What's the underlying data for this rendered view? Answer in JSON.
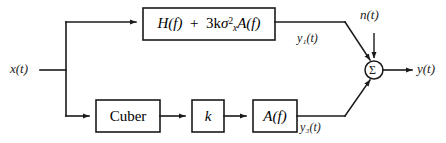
{
  "diagram": {
    "background_color": "#ffffff",
    "line_color": "#1a1a1a",
    "input": {
      "label": "x(t)",
      "name": "input-signal-label"
    },
    "output": {
      "label": "y(t)",
      "name": "output-signal-label"
    },
    "noise": {
      "label": "n(t)",
      "name": "noise-signal-label"
    },
    "blocks": [
      {
        "id": "linear-path-block",
        "label_parts": {
          "h_of_f": "H(f)",
          "plus": "+",
          "gain": "3k",
          "sigma": "σ",
          "sigma_sup": "2",
          "sigma_sub": "x",
          "a_of_f": "A(f)"
        },
        "label_plain": "H(f) + 3kσ²ₓA(f)",
        "x": 143,
        "y": 8,
        "width": 132,
        "height": 32
      },
      {
        "id": "cuber-block",
        "label_plain": "Cuber",
        "x": 96,
        "y": 100,
        "width": 64,
        "height": 32
      },
      {
        "id": "gain-k-block",
        "label_plain": "k",
        "x": 192,
        "y": 100,
        "width": 32,
        "height": 32
      },
      {
        "id": "filter-a-block",
        "label_plain": "A(f)",
        "x": 253,
        "y": 100,
        "width": 44,
        "height": 32
      }
    ],
    "signal_labels": [
      {
        "id": "y1-label",
        "label": "y₁(t)",
        "base": "y",
        "sub": "1",
        "tail": "(t)"
      },
      {
        "id": "y3-label",
        "label": "y₃(t)",
        "base": "y",
        "sub": "3",
        "tail": "(t)"
      }
    ],
    "summer": {
      "id": "summing-junction",
      "glyph": "Σ",
      "cx": 374,
      "cy": 70,
      "r": 9,
      "inputs": [
        "y1(t)",
        "n(t)",
        "y3(t)"
      ],
      "output": "y(t)"
    }
  }
}
